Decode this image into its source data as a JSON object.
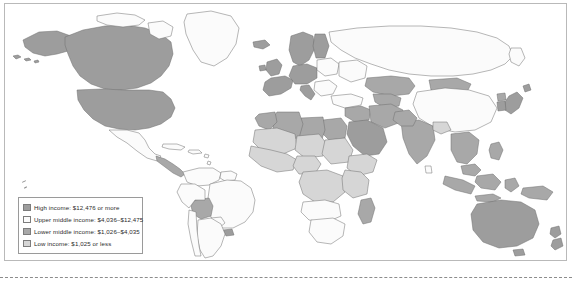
{
  "figure": {
    "type": "choropleth-world-map",
    "title": "",
    "panel_border_color": "#b9b9b9",
    "background": "#ffffff"
  },
  "legend": {
    "name": "income-classification-legend",
    "border_color": "#9a9a9a",
    "items": [
      {
        "key": "high-income",
        "label": "High income: $12,476 or more",
        "class_name": "High income",
        "range_text": "$12,476 or more",
        "min": 12476,
        "max": null,
        "color": "#9d9d9d"
      },
      {
        "key": "upper-middle-income",
        "label": "Upper middle income: $4,036–$12,475",
        "class_name": "Upper middle income",
        "range_text": "$4,036–$12,475",
        "min": 4036,
        "max": 12475,
        "color": "#fbfbfb"
      },
      {
        "key": "lower-middle-income",
        "label": "Lower middle income: $1,026–$4,035",
        "class_name": "Lower middle income",
        "range_text": "$1,026–$4,035",
        "min": 1026,
        "max": 4035,
        "color": "#a8a8a8"
      },
      {
        "key": "low-income",
        "label": "Low income: $1,025 or less",
        "class_name": "Low income",
        "range_text": "$1,025 or less",
        "min": null,
        "max": 1025,
        "color": "#d6d6d6"
      }
    ]
  },
  "map": {
    "name": "world-income-map",
    "projection": "equirectangular-style",
    "ocean_color": "#ffffff",
    "border_color": "#6f6f6f",
    "regions": [
      {
        "name": "greenland",
        "class": "upper-middle-income"
      },
      {
        "name": "canada",
        "class": "high-income"
      },
      {
        "name": "united-states",
        "class": "high-income"
      },
      {
        "name": "alaska",
        "class": "high-income"
      },
      {
        "name": "mexico",
        "class": "upper-middle-income"
      },
      {
        "name": "central-america",
        "class": "lower-middle-income"
      },
      {
        "name": "caribbean",
        "class": "upper-middle-income"
      },
      {
        "name": "colombia-venezuela",
        "class": "upper-middle-income"
      },
      {
        "name": "brazil",
        "class": "upper-middle-income"
      },
      {
        "name": "bolivia",
        "class": "lower-middle-income"
      },
      {
        "name": "peru-ecuador",
        "class": "upper-middle-income"
      },
      {
        "name": "chile",
        "class": "upper-middle-income"
      },
      {
        "name": "argentina",
        "class": "upper-middle-income"
      },
      {
        "name": "uruguay",
        "class": "high-income"
      },
      {
        "name": "western-europe",
        "class": "high-income"
      },
      {
        "name": "scandinavia",
        "class": "high-income"
      },
      {
        "name": "eastern-europe",
        "class": "upper-middle-income"
      },
      {
        "name": "russia",
        "class": "upper-middle-income"
      },
      {
        "name": "north-africa",
        "class": "lower-middle-income"
      },
      {
        "name": "sahel",
        "class": "low-income"
      },
      {
        "name": "west-africa",
        "class": "low-income"
      },
      {
        "name": "central-africa",
        "class": "low-income"
      },
      {
        "name": "east-africa",
        "class": "low-income"
      },
      {
        "name": "southern-africa",
        "class": "upper-middle-income"
      },
      {
        "name": "south-africa",
        "class": "upper-middle-income"
      },
      {
        "name": "arabian-peninsula",
        "class": "high-income"
      },
      {
        "name": "turkey",
        "class": "upper-middle-income"
      },
      {
        "name": "central-asia",
        "class": "lower-middle-income"
      },
      {
        "name": "india",
        "class": "lower-middle-income"
      },
      {
        "name": "china",
        "class": "upper-middle-income"
      },
      {
        "name": "mongolia",
        "class": "lower-middle-income"
      },
      {
        "name": "japan",
        "class": "high-income"
      },
      {
        "name": "south-korea",
        "class": "high-income"
      },
      {
        "name": "southeast-asia",
        "class": "lower-middle-income"
      },
      {
        "name": "indonesia",
        "class": "lower-middle-income"
      },
      {
        "name": "australia",
        "class": "high-income"
      },
      {
        "name": "new-zealand",
        "class": "high-income"
      },
      {
        "name": "papua-new-guinea",
        "class": "lower-middle-income"
      }
    ]
  },
  "artifacts": {
    "bottom_rule_style": "dashed",
    "bottom_rule_color": "#8c8c8c"
  }
}
